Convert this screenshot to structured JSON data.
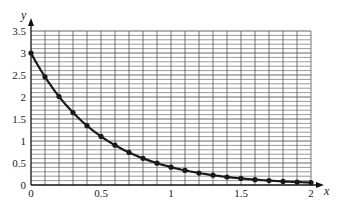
{
  "chart_data": {
    "type": "line",
    "title": "",
    "xlabel": "x",
    "ylabel": "y",
    "xlim": [
      0,
      2
    ],
    "ylim": [
      0,
      3.5
    ],
    "grid": true,
    "grid_minor_step": {
      "x": 0.1,
      "y": 0.1
    },
    "x_ticks": [
      0,
      0.5,
      1,
      1.5,
      2
    ],
    "x_tick_labels": [
      "0",
      "0.5",
      "1",
      "1.5",
      "2"
    ],
    "y_ticks": [
      0,
      0.5,
      1,
      1.5,
      2,
      2.5,
      3,
      3.5
    ],
    "y_tick_labels": [
      "0",
      "0.5",
      "1",
      "1.5",
      "2",
      "2.5",
      "3",
      "3.5"
    ],
    "legend": null,
    "series": [
      {
        "name": "y = 3e^(-2x)",
        "markers": true,
        "x": [
          0,
          0.1,
          0.2,
          0.3,
          0.4,
          0.5,
          0.6,
          0.7,
          0.8,
          0.9,
          1.0,
          1.1,
          1.2,
          1.3,
          1.4,
          1.5,
          1.6,
          1.7,
          1.8,
          1.9,
          2.0
        ],
        "values": [
          3.0,
          2.456,
          2.011,
          1.646,
          1.348,
          1.104,
          0.904,
          0.74,
          0.606,
          0.496,
          0.406,
          0.332,
          0.272,
          0.223,
          0.182,
          0.149,
          0.122,
          0.1,
          0.082,
          0.067,
          0.055
        ]
      }
    ]
  },
  "colors": {
    "grid": "#555555",
    "axis": "#111111",
    "curve": "#1a1a1a"
  }
}
